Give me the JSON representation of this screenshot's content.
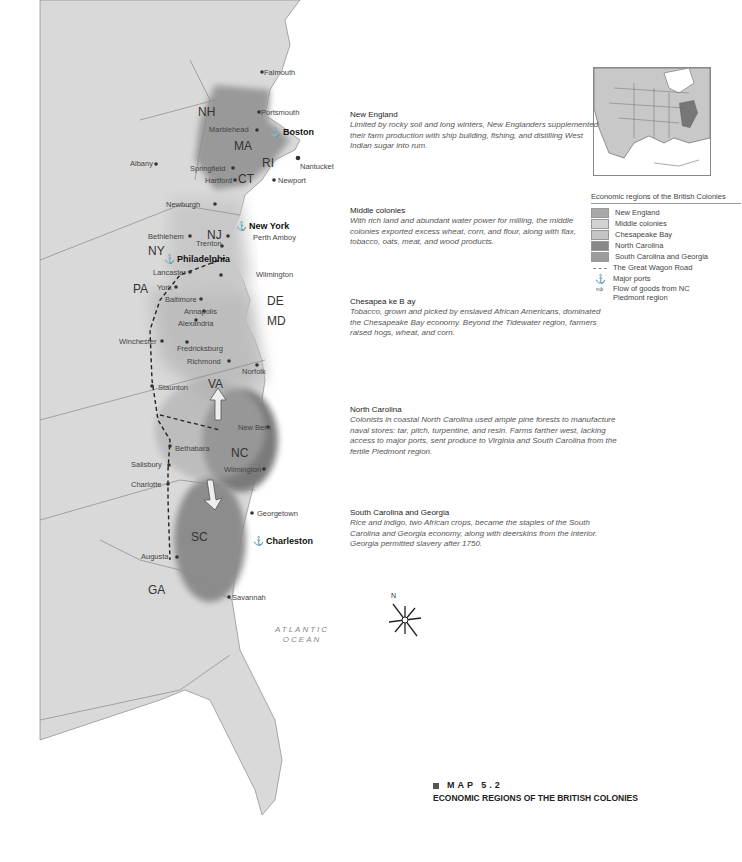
{
  "map": {
    "states": [
      {
        "abbr": "NH",
        "x": 198,
        "y": 106
      },
      {
        "abbr": "MA",
        "x": 234,
        "y": 140
      },
      {
        "abbr": "RI",
        "x": 262,
        "y": 157
      },
      {
        "abbr": "CT",
        "x": 238,
        "y": 173
      },
      {
        "abbr": "NY",
        "x": 148,
        "y": 245
      },
      {
        "abbr": "NJ",
        "x": 207,
        "y": 229
      },
      {
        "abbr": "PA",
        "x": 133,
        "y": 283
      },
      {
        "abbr": "DE",
        "x": 267,
        "y": 295
      },
      {
        "abbr": "MD",
        "x": 267,
        "y": 315
      },
      {
        "abbr": "VA",
        "x": 208,
        "y": 378
      },
      {
        "abbr": "NC",
        "x": 231,
        "y": 447
      },
      {
        "abbr": "SC",
        "x": 191,
        "y": 531
      },
      {
        "abbr": "GA",
        "x": 148,
        "y": 584
      }
    ],
    "cities": [
      {
        "name": "Falmouth",
        "x": 264,
        "y": 69
      },
      {
        "name": "Portsmouth",
        "x": 261,
        "y": 109
      },
      {
        "name": "Marblehead",
        "x": 209,
        "y": 126
      },
      {
        "name": "Boston",
        "x": 270,
        "y": 128,
        "major": true,
        "port": true
      },
      {
        "name": "Albany",
        "x": 130,
        "y": 160
      },
      {
        "name": "Springfield",
        "x": 190,
        "y": 165
      },
      {
        "name": "Nantucket",
        "x": 300,
        "y": 163
      },
      {
        "name": "Hartford",
        "x": 205,
        "y": 177
      },
      {
        "name": "Newport",
        "x": 278,
        "y": 177
      },
      {
        "name": "Newburgh",
        "x": 166,
        "y": 201
      },
      {
        "name": "New York",
        "x": 236,
        "y": 222,
        "major": true,
        "port": true
      },
      {
        "name": "Bethlehem",
        "x": 148,
        "y": 233
      },
      {
        "name": "Perth Amboy",
        "x": 253,
        "y": 234
      },
      {
        "name": "Trenton",
        "x": 196,
        "y": 240
      },
      {
        "name": "Philadelphia",
        "x": 164,
        "y": 255,
        "major": true,
        "port": true
      },
      {
        "name": "Lancaster",
        "x": 153,
        "y": 269
      },
      {
        "name": "Wilmington",
        "x": 256,
        "y": 271
      },
      {
        "name": "York",
        "x": 157,
        "y": 284
      },
      {
        "name": "Baltimore",
        "x": 165,
        "y": 296
      },
      {
        "name": "Annapolis",
        "x": 184,
        "y": 308
      },
      {
        "name": "Alexandria",
        "x": 178,
        "y": 320
      },
      {
        "name": "Winchester",
        "x": 119,
        "y": 338
      },
      {
        "name": "Fredricksburg",
        "x": 177,
        "y": 345
      },
      {
        "name": "Richmond",
        "x": 187,
        "y": 358
      },
      {
        "name": "Norfolk",
        "x": 242,
        "y": 368
      },
      {
        "name": "Staunton",
        "x": 158,
        "y": 384
      },
      {
        "name": "New Bern",
        "x": 238,
        "y": 424
      },
      {
        "name": "Bethabara",
        "x": 175,
        "y": 445
      },
      {
        "name": "Salisbury",
        "x": 131,
        "y": 461
      },
      {
        "name": "Wilmington",
        "x": 224,
        "y": 466
      },
      {
        "name": "Charlotte",
        "x": 131,
        "y": 481
      },
      {
        "name": "Georgetown",
        "x": 257,
        "y": 510
      },
      {
        "name": "Charleston",
        "x": 253,
        "y": 537,
        "major": true,
        "port": true
      },
      {
        "name": "Augusta",
        "x": 141,
        "y": 553
      },
      {
        "name": "Savannah",
        "x": 232,
        "y": 594
      }
    ],
    "ocean_label": [
      "ATLANTIC",
      "OCEAN"
    ],
    "compass_label": "N"
  },
  "regions": [
    {
      "title": "New England",
      "body": "Limited by rocky soil and long winters, New Englanders supplemented their farm production with ship building, fishing, and distilling West Indian sugar into rum."
    },
    {
      "title": "Middle colonies",
      "body": "With rich land and abundant water power for milling, the  middle colonies exported excess wheat, corn, and flour, along with flax, tobacco, oats, meat, and wood products."
    },
    {
      "title": "Chesapea  ke B ay",
      "body": "Tobacco, grown and picked by enslaved African Americans, dominated the Chesapeake Bay economy. Beyond the Tidewater region, farmers raised hogs, wheat, and corn."
    },
    {
      "title": "North Carolina",
      "body": "Colonists in coastal North Carolina used ample pine forests to manufacture naval stores: tar, pitch, turpentine, and resin. Farms farther west, lacking access to major ports, sent produce to Virginia and South Carolina from the fertile Piedmont region."
    },
    {
      "title": "South Carolina and Georgia",
      "body": "Rice and indigo, two African crops, became the staples of the South Carolina and Georgia economy, along with deerskins from the interior. Georgia permitted slavery after 1750."
    }
  ],
  "legend": {
    "title": "Economic regions of the British Colonies",
    "items": [
      {
        "label": "New England",
        "color": "#a8a8a8"
      },
      {
        "label": "Middle colonies",
        "color": "#d2d2d2"
      },
      {
        "label": "Chesapeake Bay",
        "color": "#c4c4c4"
      },
      {
        "label": "North Carolina",
        "color": "#888888"
      },
      {
        "label": "South Carolina and Georgia",
        "color": "#9c9c9c"
      }
    ],
    "symbols": [
      {
        "label": "The Great Wagon Road",
        "icon": "dashed-line"
      },
      {
        "label": "Major ports",
        "icon": "anchor-icon"
      },
      {
        "label": "Flow of goods from NC Piedmont region",
        "icon": "hollow-arrow"
      }
    ]
  },
  "caption": {
    "number": "MAP 5.2",
    "title": "ECONOMIC REGIONS OF THE BRITISH COLONIES"
  }
}
